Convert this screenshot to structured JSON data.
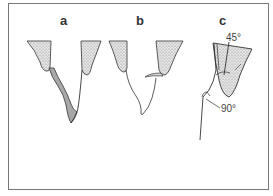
{
  "panels": [
    {
      "label": "a"
    },
    {
      "label": "b"
    },
    {
      "label": "c"
    }
  ],
  "annotations": {
    "angle_top": "45°",
    "angle_bottom": "90°"
  },
  "colors": {
    "stipple": "#c9c9c9",
    "shaded_band": "#a8a8a8",
    "line": "#333333"
  }
}
